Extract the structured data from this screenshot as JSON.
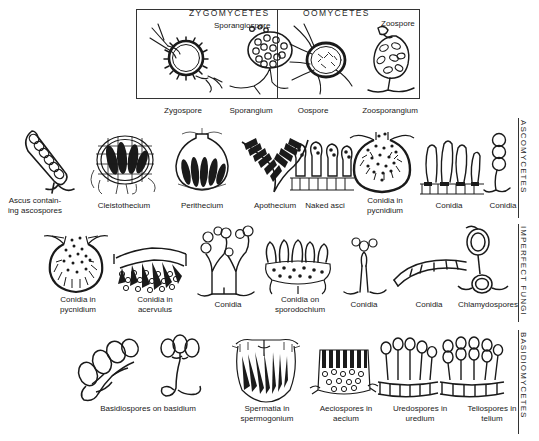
{
  "plate": {
    "title_sections": {
      "zygomycetes": "ZYGOMYCETES",
      "oomycetes": "OOMYCETES"
    },
    "inline_labels": {
      "sporangiospore": "Sporangiospore",
      "zoospore": "Zoospore"
    },
    "side_labels": {
      "ascomycetes": "ASCOMYCETES",
      "imperfect_fungi": "IMPERFECT FUNGI",
      "basidiomycetes": "BASIDIOMYCETES"
    },
    "rows": [
      {
        "id": "row-top",
        "group": "Zygomycetes and Oomycetes",
        "figures": [
          {
            "id": "zygospore",
            "caption": "Zygospore"
          },
          {
            "id": "sporangium",
            "caption": "Sporangium"
          },
          {
            "id": "oospore",
            "caption": "Oospore"
          },
          {
            "id": "zoosporangium",
            "caption": "Zoosporangium"
          }
        ]
      },
      {
        "id": "row-ascomycetes",
        "group": "ASCOMYCETES",
        "figures": [
          {
            "id": "ascus",
            "caption": "Ascus contain-\ning ascospores"
          },
          {
            "id": "cleistothecium",
            "caption": "Cleistothecium"
          },
          {
            "id": "perithecium",
            "caption": "Perithecium"
          },
          {
            "id": "apothecium",
            "caption": "Apothecium"
          },
          {
            "id": "naked-asci",
            "caption": "Naked  asci"
          },
          {
            "id": "conidia-pycnidium",
            "caption": "Conidia   in\npycnidium"
          },
          {
            "id": "conidia-asco-1",
            "caption": "Conidia"
          },
          {
            "id": "conidia-asco-2",
            "caption": "Conidia"
          }
        ]
      },
      {
        "id": "row-imperfect-fungi",
        "group": "IMPERFECT FUNGI",
        "figures": [
          {
            "id": "conidia-in-pycnidium",
            "caption": "Conidia   in\npycnidium"
          },
          {
            "id": "conidia-in-acervulus",
            "caption": "Conidia  in\nacervulus"
          },
          {
            "id": "conidia-imp-1",
            "caption": "Conidia"
          },
          {
            "id": "conidia-sporodochium",
            "caption": "Conidia  on\nsporodochium"
          },
          {
            "id": "conidia-imp-2",
            "caption": "Conidia"
          },
          {
            "id": "conidia-imp-3",
            "caption": "Conidia"
          },
          {
            "id": "chlamydospores",
            "caption": "Chlamydospores"
          }
        ]
      },
      {
        "id": "row-basidiomycetes",
        "group": "BASIDIOMYCETES",
        "figures": [
          {
            "id": "basidiospores-a",
            "caption": ""
          },
          {
            "id": "basidiospores-b",
            "caption": ""
          },
          {
            "id": "spermatia",
            "caption": "Spermatia in\nspermogonium"
          },
          {
            "id": "aeciospores",
            "caption": "Aeciospores in\naecium"
          },
          {
            "id": "uredospores",
            "caption": "Uredospores in\nuredium"
          },
          {
            "id": "teliospores",
            "caption": "Teliospores  in\ntelium"
          }
        ],
        "span_caption": "Basidiospores on  basidium"
      }
    ],
    "colors": {
      "ink": "#1a1a1a",
      "rule": "#333333",
      "background": "#ffffff"
    }
  }
}
